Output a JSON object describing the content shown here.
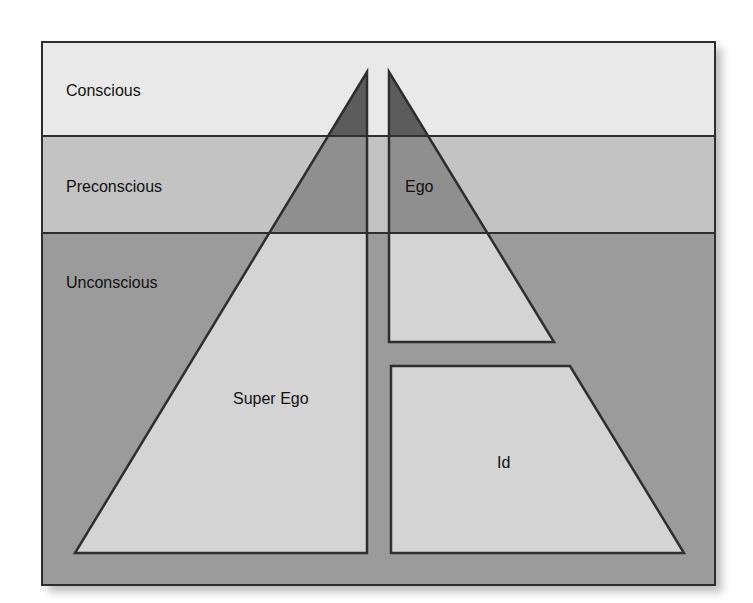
{
  "diagram": {
    "levels": [
      {
        "label": "Conscious",
        "color": "#e9e9e9"
      },
      {
        "label": "Preconscious",
        "color": "#c3c3c3"
      },
      {
        "label": "Unconscious",
        "color": "#9b9b9b"
      }
    ],
    "structures": [
      {
        "label": "Super Ego"
      },
      {
        "label": "Ego"
      },
      {
        "label": "Id"
      }
    ],
    "colors": {
      "outline": "#2e2e2e",
      "shape_conscious": "#5c5c5c",
      "shape_preconscious": "#8f8f8f",
      "shape_unconscious": "#d4d4d4",
      "shadow": "#d0d0d0"
    }
  }
}
